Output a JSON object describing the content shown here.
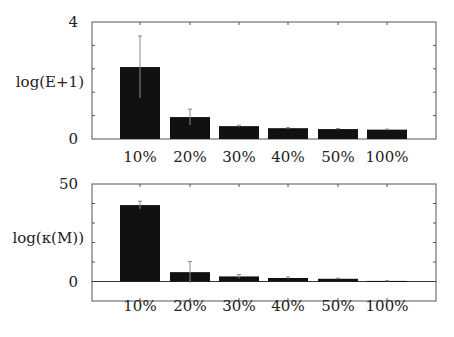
{
  "chart_data": [
    {
      "type": "bar",
      "title": "",
      "xlabel": "",
      "ylabel": "log(E+1)",
      "categories": [
        "10%",
        "20%",
        "30%",
        "40%",
        "50%",
        "100%"
      ],
      "values": [
        2.46,
        0.75,
        0.44,
        0.37,
        0.34,
        0.32
      ],
      "error": [
        1.06,
        0.27,
        0.03,
        0.02,
        0.02,
        0.02
      ],
      "ylim": [
        0,
        4
      ],
      "yticks_labeled": [
        0,
        4
      ],
      "ytick_step": 0.8,
      "grid": false,
      "bar_color": "#111111"
    },
    {
      "type": "bar",
      "title": "",
      "xlabel": "",
      "ylabel": "log(κ(M))",
      "categories": [
        "10%",
        "20%",
        "30%",
        "40%",
        "50%",
        "100%"
      ],
      "values": [
        39.2,
        4.8,
        2.6,
        1.8,
        1.4,
        0.3
      ],
      "error": [
        2.0,
        5.5,
        1.0,
        0.5,
        0.3,
        0.1
      ],
      "ylim": [
        -10,
        50
      ],
      "yticks_labeled": [
        0,
        50
      ],
      "ytick_step": 10,
      "zero_line": true,
      "grid": false,
      "bar_color": "#111111"
    }
  ]
}
